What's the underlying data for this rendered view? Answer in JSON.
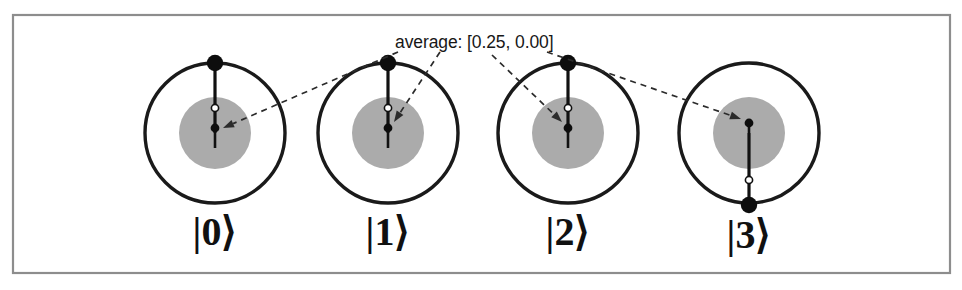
{
  "figure": {
    "background_color": "#ffffff",
    "frame": {
      "name": "figure-border",
      "x": 13,
      "y": 15,
      "width": 937,
      "height": 258,
      "stroke_color": "#8d8d8d"
    },
    "annotation": {
      "text": "average: [0.25, 0.00]",
      "x": 395,
      "y": 48,
      "color": "#171717"
    },
    "colors": {
      "ring": "#1a1a1a",
      "disk": "#ababab",
      "needle": "#111111",
      "dot": "#0d0d0d",
      "hollow_fill": "#ffffff",
      "dashed_leader": "#2b2b2b",
      "frame": "#8d8d8d",
      "label": "#111111"
    }
  },
  "chart_data": {
    "type": "scatter",
    "title": "average: [0.25, 0.00]",
    "xlabel": "",
    "ylabel": "",
    "average_vector": [
      0.25,
      0.0
    ],
    "outer_radius": 70,
    "inner_radius": 36,
    "series": [
      {
        "name": "|0⟩",
        "label": "|0⟩",
        "center": [
          215,
          133
        ],
        "needle_angle_deg": 90,
        "rim_dot": [
          215,
          63
        ],
        "hollow_marker": [
          215,
          108
        ],
        "avg_dot": [
          215,
          128
        ],
        "needle_tail_end": [
          215,
          148
        ],
        "label_pos": [
          215,
          245
        ]
      },
      {
        "name": "|1⟩",
        "label": "|1⟩",
        "center": [
          388,
          133
        ],
        "needle_angle_deg": 90,
        "rim_dot": [
          388,
          63
        ],
        "hollow_marker": [
          388,
          108
        ],
        "avg_dot": [
          388,
          128
        ],
        "needle_tail_end": [
          388,
          148
        ],
        "label_pos": [
          388,
          245
        ]
      },
      {
        "name": "|2⟩",
        "label": "|2⟩",
        "center": [
          568,
          133
        ],
        "needle_angle_deg": 90,
        "rim_dot": [
          568,
          63
        ],
        "hollow_marker": [
          568,
          108
        ],
        "avg_dot": [
          568,
          128
        ],
        "needle_tail_end": [
          568,
          148
        ],
        "label_pos": [
          568,
          245
        ]
      },
      {
        "name": "|3⟩",
        "label": "|3⟩",
        "center": [
          749,
          133
        ],
        "needle_angle_deg": -90,
        "rim_dot": [
          749,
          205
        ],
        "hollow_marker": [
          749,
          180
        ],
        "avg_dot": [
          749,
          123
        ],
        "needle_tail_end": [
          749,
          123
        ],
        "label_pos": [
          749,
          248
        ]
      }
    ],
    "leaders": [
      {
        "name": "leader-to-0",
        "from": [
          398,
          52
        ],
        "to": [
          223,
          128
        ]
      },
      {
        "name": "leader-to-1",
        "from": [
          440,
          52
        ],
        "to": [
          394,
          122
        ]
      },
      {
        "name": "leader-to-2",
        "from": [
          492,
          55
        ],
        "to": [
          562,
          122
        ]
      },
      {
        "name": "leader-to-3",
        "from": [
          547,
          52
        ],
        "to": [
          741,
          119
        ]
      }
    ]
  }
}
